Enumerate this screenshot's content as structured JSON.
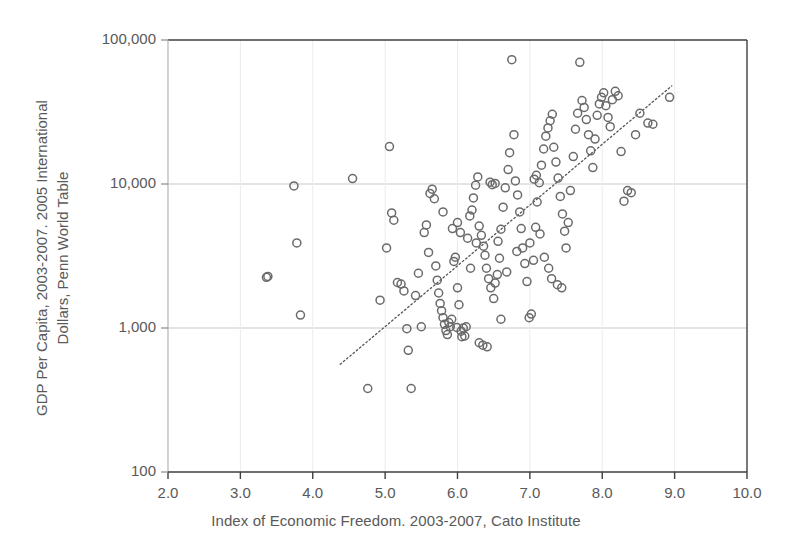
{
  "chart_data": {
    "type": "scatter",
    "title": "",
    "xlabel": "Index of Economic Freedom. 2003-2007, Cato Institute",
    "ylabel_line1": "GDP Per Capita, 2003-2007. 2005 International",
    "ylabel_line2": "Dollars, Penn World Table",
    "xlim": [
      2.0,
      10.0
    ],
    "ylim": [
      100,
      100000
    ],
    "yscale": "log",
    "xticks": [
      "2.0",
      "3.0",
      "4.0",
      "5.0",
      "6.0",
      "7.0",
      "8.0",
      "9.0",
      "10.0"
    ],
    "xtick_values": [
      2.0,
      3.0,
      4.0,
      5.0,
      6.0,
      7.0,
      8.0,
      9.0,
      10.0
    ],
    "yticks": [
      "100",
      "1,000",
      "10,000",
      "100,000"
    ],
    "ytick_values": [
      100,
      1000,
      10000,
      100000
    ],
    "grid": "horizontal-major-and-minor-vertical",
    "legend": "none",
    "marker": {
      "shape": "circle",
      "filled": false,
      "stroke": "#6a6a6a",
      "size_px": 8
    },
    "trendline": {
      "style": "dotted",
      "color": "#555555",
      "x_start": 4.38,
      "y_start": 560,
      "x_end": 8.96,
      "y_end": 48000
    },
    "series": [
      {
        "name": "Countries",
        "points": [
          [
            3.36,
            2250
          ],
          [
            3.38,
            2280
          ],
          [
            3.74,
            9700
          ],
          [
            3.78,
            3900
          ],
          [
            3.83,
            1230
          ],
          [
            4.55,
            10900
          ],
          [
            4.76,
            380
          ],
          [
            4.93,
            1560
          ],
          [
            5.02,
            3600
          ],
          [
            5.06,
            18200
          ],
          [
            5.09,
            6300
          ],
          [
            5.12,
            5600
          ],
          [
            5.17,
            2070
          ],
          [
            5.22,
            2020
          ],
          [
            5.26,
            1810
          ],
          [
            5.3,
            990
          ],
          [
            5.32,
            700
          ],
          [
            5.36,
            380
          ],
          [
            5.42,
            1680
          ],
          [
            5.46,
            2400
          ],
          [
            5.5,
            1020
          ],
          [
            5.54,
            4600
          ],
          [
            5.57,
            5200
          ],
          [
            5.6,
            3350
          ],
          [
            5.62,
            8600
          ],
          [
            5.65,
            9200
          ],
          [
            5.68,
            7900
          ],
          [
            5.7,
            2700
          ],
          [
            5.72,
            2150
          ],
          [
            5.74,
            1750
          ],
          [
            5.76,
            1480
          ],
          [
            5.78,
            1320
          ],
          [
            5.8,
            1180
          ],
          [
            5.82,
            1060
          ],
          [
            5.84,
            960
          ],
          [
            5.86,
            900
          ],
          [
            5.9,
            1020
          ],
          [
            5.92,
            1150
          ],
          [
            5.95,
            2900
          ],
          [
            5.97,
            3100
          ],
          [
            6.0,
            1900
          ],
          [
            6.02,
            1450
          ],
          [
            6.05,
            950
          ],
          [
            6.08,
            1000
          ],
          [
            6.1,
            880
          ],
          [
            6.14,
            4200
          ],
          [
            6.17,
            6000
          ],
          [
            6.2,
            6600
          ],
          [
            6.22,
            8000
          ],
          [
            6.25,
            9800
          ],
          [
            6.28,
            11200
          ],
          [
            6.3,
            5100
          ],
          [
            6.33,
            4400
          ],
          [
            6.36,
            3700
          ],
          [
            6.38,
            3200
          ],
          [
            6.4,
            2600
          ],
          [
            6.43,
            2200
          ],
          [
            6.46,
            1900
          ],
          [
            6.5,
            1600
          ],
          [
            6.55,
            2350
          ],
          [
            6.58,
            3050
          ],
          [
            6.6,
            4850
          ],
          [
            6.63,
            6900
          ],
          [
            6.66,
            9400
          ],
          [
            6.7,
            12600
          ],
          [
            6.72,
            16500
          ],
          [
            6.75,
            73000
          ],
          [
            6.78,
            22000
          ],
          [
            6.8,
            10500
          ],
          [
            6.83,
            8400
          ],
          [
            6.86,
            6400
          ],
          [
            6.88,
            4900
          ],
          [
            6.9,
            3600
          ],
          [
            6.93,
            2800
          ],
          [
            6.96,
            2100
          ],
          [
            6.99,
            1180
          ],
          [
            7.02,
            1250
          ],
          [
            7.05,
            2950
          ],
          [
            7.08,
            5000
          ],
          [
            7.1,
            7500
          ],
          [
            7.13,
            10200
          ],
          [
            7.16,
            13500
          ],
          [
            7.19,
            17500
          ],
          [
            7.22,
            21500
          ],
          [
            7.25,
            24500
          ],
          [
            7.28,
            27500
          ],
          [
            7.31,
            30500
          ],
          [
            7.33,
            18000
          ],
          [
            7.36,
            14200
          ],
          [
            7.39,
            11000
          ],
          [
            7.42,
            8200
          ],
          [
            7.45,
            6200
          ],
          [
            7.48,
            4700
          ],
          [
            7.5,
            3600
          ],
          [
            7.53,
            5400
          ],
          [
            7.56,
            9000
          ],
          [
            7.6,
            15500
          ],
          [
            7.63,
            24000
          ],
          [
            7.66,
            31000
          ],
          [
            7.69,
            70000
          ],
          [
            7.72,
            38000
          ],
          [
            7.75,
            34000
          ],
          [
            7.78,
            28000
          ],
          [
            7.81,
            22000
          ],
          [
            7.84,
            17000
          ],
          [
            7.87,
            13000
          ],
          [
            7.9,
            20500
          ],
          [
            7.93,
            30000
          ],
          [
            7.96,
            36000
          ],
          [
            7.99,
            40000
          ],
          [
            8.02,
            43000
          ],
          [
            8.05,
            35000
          ],
          [
            8.08,
            29000
          ],
          [
            8.11,
            25000
          ],
          [
            8.14,
            38500
          ],
          [
            8.18,
            44000
          ],
          [
            8.22,
            41000
          ],
          [
            8.26,
            16800
          ],
          [
            8.3,
            7600
          ],
          [
            8.35,
            9000
          ],
          [
            8.4,
            8700
          ],
          [
            8.46,
            22000
          ],
          [
            8.52,
            31000
          ],
          [
            8.63,
            26500
          ],
          [
            8.7,
            26000
          ],
          [
            8.93,
            40000
          ],
          [
            6.45,
            10300
          ],
          [
            6.48,
            9900
          ],
          [
            6.52,
            10100
          ],
          [
            5.88,
            1090
          ],
          [
            6.12,
            1020
          ],
          [
            6.06,
            870
          ],
          [
            5.99,
            1010
          ],
          [
            6.35,
            760
          ],
          [
            6.3,
            790
          ],
          [
            6.41,
            740
          ],
          [
            7.06,
            10800
          ],
          [
            7.09,
            11500
          ],
          [
            6.6,
            1150
          ],
          [
            6.68,
            2450
          ],
          [
            6.52,
            2050
          ],
          [
            6.18,
            2600
          ],
          [
            5.93,
            4900
          ],
          [
            6.0,
            5400
          ],
          [
            6.04,
            4600
          ],
          [
            5.8,
            6400
          ],
          [
            6.26,
            3900
          ],
          [
            6.56,
            4000
          ],
          [
            6.82,
            3400
          ],
          [
            7.0,
            3900
          ],
          [
            7.14,
            4500
          ],
          [
            7.2,
            3100
          ],
          [
            7.26,
            2600
          ],
          [
            7.3,
            2200
          ],
          [
            7.38,
            2000
          ],
          [
            7.44,
            1900
          ]
        ]
      }
    ]
  }
}
